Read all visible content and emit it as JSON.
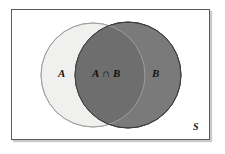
{
  "figure": {
    "type": "venn-diagram",
    "background_color": "#ffffff"
  },
  "universe": {
    "label": "S",
    "border_color": "#5a5a5a",
    "fill_color": "#ffffff"
  },
  "sets": [
    {
      "id": "A",
      "label": "A",
      "fill_color": "#f0f0ee",
      "stroke_color": "#b9b9b7",
      "cx": 93,
      "cy": 75,
      "r": 52
    },
    {
      "id": "B",
      "label": "B",
      "fill_color": "#7a7a7a",
      "stroke_color": "#3c3c3c",
      "cx": 128,
      "cy": 75,
      "r": 53
    }
  ],
  "intersection": {
    "label": "A ∩ B",
    "fill_color": "#6e6e6e",
    "stroke_color": "#3c3c3c"
  },
  "labels": {
    "set_a": "A",
    "set_b": "B",
    "intersection": "A ∩ B",
    "universal_set": "S"
  }
}
